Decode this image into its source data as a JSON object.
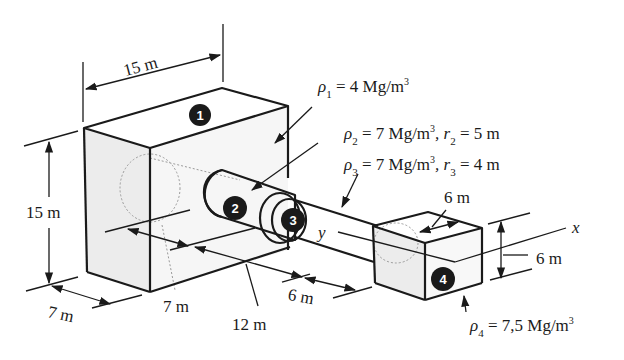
{
  "figure": {
    "type": "isometric composite-body diagram",
    "axes": {
      "x_label": "x",
      "y_label": "y"
    },
    "parts": [
      {
        "id": "1",
        "label": "1",
        "shape": "rectangular block",
        "density": "ρ₁ = 4 Mg/m³"
      },
      {
        "id": "2",
        "label": "2",
        "shape": "cylinder",
        "density": "ρ₂ = 7 Mg/m³",
        "radius": "r₂ = 5 m"
      },
      {
        "id": "3",
        "label": "3",
        "shape": "cylinder (rod)",
        "density": "ρ₃ = 7 Mg/m³",
        "radius": "r₃ = 4 m"
      },
      {
        "id": "4",
        "label": "4",
        "shape": "cube",
        "density": "ρ₄ = 7.5 Mg/m³"
      }
    ],
    "dimensions": {
      "block_width_top": "15 m",
      "block_height": "15 m",
      "block_depth_left": "7 m",
      "block_depth_mid": "7 m",
      "cylinder_length": "12 m",
      "rod_length": "6 m",
      "cube_depth": "6 m",
      "cube_height": "6 m"
    },
    "annotations": {
      "rho1": {
        "symbol": "ρ",
        "sub": "1",
        "text": " = 4 Mg/m",
        "sup": "3"
      },
      "rho2": {
        "symbol": "ρ",
        "sub": "2",
        "text": " = 7 Mg/m",
        "sup": "3",
        "tail": ", r",
        "tail_sub": "2",
        "tail_text": " = 5 m"
      },
      "rho3": {
        "symbol": "ρ",
        "sub": "3",
        "text": " = 7 Mg/m",
        "sup": "3",
        "tail": ", r",
        "tail_sub": "3",
        "tail_text": " = 4 m"
      },
      "rho4": {
        "symbol": "ρ",
        "sub": "4",
        "text": " = 7,5 Mg/m",
        "sup": "3"
      }
    },
    "colors": {
      "ink": "#1a1a1a",
      "shade": "#ececec",
      "hidden_line": "#9a9a9a",
      "background": "#ffffff"
    }
  }
}
